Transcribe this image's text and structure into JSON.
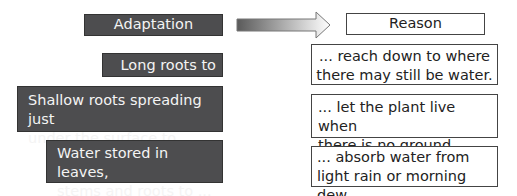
{
  "headers": {
    "adaptation": "Adaptation",
    "reason": "Reason"
  },
  "adaptations": [
    {
      "line1": "Long roots to ...",
      "line2": ""
    },
    {
      "line1": "Shallow roots spreading just",
      "line2": "under the surface to ..."
    },
    {
      "line1": "Water stored in leaves,",
      "line2": "stems and roots to ..."
    }
  ],
  "reasons": [
    {
      "line1": "... reach down to where",
      "line2": "there may still be water."
    },
    {
      "line1": "... let the plant live when",
      "line2": "there is no ground water."
    },
    {
      "line1": "... absorb water from",
      "line2": "light rain or morning dew."
    }
  ],
  "colors": {
    "dark_box": "#4d4d4f",
    "dark_text": "#f4f4f4",
    "light_border": "#444444"
  },
  "icons": {
    "arrow": "right-arrow-gradient"
  }
}
